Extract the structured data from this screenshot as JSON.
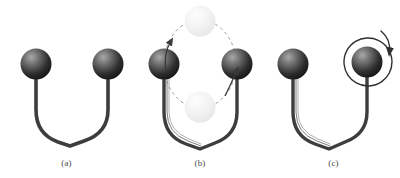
{
  "figure": {
    "background_color": "#ffffff",
    "panels": [
      {
        "id": "a",
        "label": "(a)",
        "caption_state": "untwisted cable with two end masses",
        "cable": {
          "style": "single-strand",
          "color": "#3a3a3a",
          "width_px": 4,
          "shape": "U-bend"
        },
        "spheres": [
          {
            "name": "left-mass",
            "cx": 36,
            "cy": 64,
            "r": 16,
            "fill_dark": "#1c1c1c",
            "fill_light": "#9a9a9a"
          },
          {
            "name": "right-mass",
            "cx": 108,
            "cy": 64,
            "r": 16,
            "fill_dark": "#1c1c1c",
            "fill_light": "#9a9a9a"
          }
        ],
        "annotations": []
      },
      {
        "id": "b",
        "label": "(b)",
        "caption_state": "masses rotating about the vertical axis; dashed orbit with ghost positions",
        "cable": {
          "style": "twisted-double-strand",
          "color": "#3a3a3a",
          "width_px": 4,
          "shape": "U-bend"
        },
        "spheres": [
          {
            "name": "left-mass",
            "cx": 36,
            "cy": 64,
            "r": 16,
            "fill_dark": "#1c1c1c",
            "fill_light": "#9a9a9a"
          },
          {
            "name": "right-mass",
            "cx": 108,
            "cy": 64,
            "r": 16,
            "fill_dark": "#1c1c1c",
            "fill_light": "#9a9a9a"
          }
        ],
        "orbit": {
          "name": "dashed-orbit-ellipse",
          "cx": 72,
          "cy": 64,
          "rx": 36,
          "ry": 44,
          "stroke": "#8c8c8c",
          "dash": "3 3"
        },
        "ghost_spheres": [
          {
            "name": "ghost-mass-top",
            "cx": 72,
            "cy": 21,
            "r": 16,
            "fill": "#ededed"
          },
          {
            "name": "ghost-mass-bottom",
            "cx": 72,
            "cy": 107,
            "r": 16,
            "fill": "#efefef"
          }
        ],
        "annotations": [
          {
            "name": "rotation-arrow-left",
            "direction": "counterclockwise",
            "color": "#3a3a3a"
          },
          {
            "name": "rotation-arrow-right",
            "direction": "counterclockwise",
            "color": "#3a3a3a"
          }
        ]
      },
      {
        "id": "c",
        "label": "(c)",
        "caption_state": "twisted cable; right mass spinning about its own axis",
        "cable": {
          "style": "twisted-double-strand",
          "color": "#3a3a3a",
          "width_px": 4,
          "shape": "U-bend"
        },
        "spheres": [
          {
            "name": "left-mass",
            "cx": 36,
            "cy": 64,
            "r": 16,
            "fill_dark": "#1c1c1c",
            "fill_light": "#9a9a9a"
          },
          {
            "name": "right-mass",
            "cx": 108,
            "cy": 64,
            "r": 16,
            "fill_dark": "#1c1c1c",
            "fill_light": "#9a9a9a"
          }
        ],
        "annotations": [
          {
            "name": "spin-arrow-circular",
            "direction": "clockwise",
            "cx": 108,
            "cy": 62,
            "r": 24,
            "color": "#2f2f2f"
          }
        ]
      }
    ]
  }
}
